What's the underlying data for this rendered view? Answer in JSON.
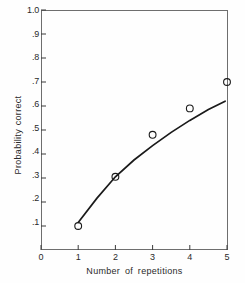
{
  "chart_data": {
    "type": "scatter",
    "title": "",
    "xlabel": "Number of repetitions",
    "ylabel": "Probability correct",
    "xlim": [
      0,
      5.05
    ],
    "ylim": [
      0,
      1.0
    ],
    "grid": false,
    "legend": "none",
    "x_ticks": [
      0,
      1,
      2,
      3,
      4,
      5
    ],
    "x_tick_labels": [
      "0",
      "1",
      "2",
      "3",
      "4",
      "5"
    ],
    "y_ticks": [
      0.1,
      0.2,
      0.3,
      0.4,
      0.5,
      0.6,
      0.7,
      0.8,
      0.9,
      1.0
    ],
    "y_tick_labels": [
      ".1",
      ".2",
      ".3",
      ".4",
      ".5",
      ".6",
      ".7",
      ".8",
      ".9",
      "1.0"
    ],
    "marker_style": "open-circle",
    "marker_color": "#1a1a1a",
    "line_color": "#1a1a1a",
    "series": [
      {
        "name": "Observed data",
        "type": "scatter",
        "x": [
          1,
          2,
          3,
          4,
          5
        ],
        "values": [
          0.1,
          0.305,
          0.48,
          0.59,
          0.7
        ]
      },
      {
        "name": "Fitted curve",
        "type": "line",
        "x": [
          1.0,
          1.5,
          2.0,
          2.5,
          3.0,
          3.5,
          4.0,
          4.5,
          4.95
        ],
        "values": [
          0.115,
          0.215,
          0.305,
          0.375,
          0.435,
          0.49,
          0.54,
          0.585,
          0.62
        ]
      }
    ]
  },
  "axes": {
    "frame_color": "#6e6e6e",
    "tick_color": "#3a3a3a"
  }
}
